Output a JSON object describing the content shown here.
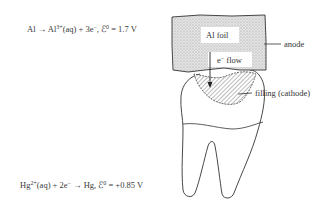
{
  "equations": {
    "anode": {
      "reactant": "Al",
      "arrow": "→",
      "product": "Al",
      "product_charge": "3+",
      "product_state": "(aq) + 3e",
      "electron_charge": "−",
      "potential_label": ", ℰ",
      "potential_sup": "0",
      "potential_value": " = 1.7 V"
    },
    "cathode": {
      "reactant": "Hg",
      "reactant_charge": "2+",
      "middle": "(aq) + 2e",
      "electron_charge": "−",
      "arrow_product": " → Hg, ℰ",
      "potential_sup": "0",
      "potential_value": " = +0.85 V"
    }
  },
  "labels": {
    "foil": "Al foil",
    "flow": "e",
    "flow_charge": "−",
    "flow_word": " flow",
    "anode": "anode",
    "filling": "filling (cathode)"
  },
  "colors": {
    "foil_fill": "#d9d9d9",
    "line": "#333333",
    "background": "#ffffff"
  }
}
